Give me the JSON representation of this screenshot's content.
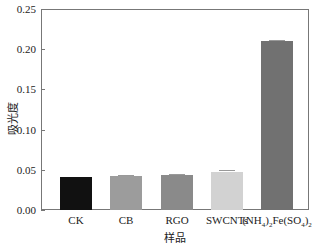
{
  "chart_data": {
    "type": "bar",
    "title": "",
    "xlabel": "样品",
    "ylabel": "吸光度",
    "ylim": [
      0,
      0.25
    ],
    "yticks": [
      "0.00",
      "0.05",
      "0.10",
      "0.15",
      "0.20",
      "0.25"
    ],
    "categories": [
      "CK",
      "CB",
      "RGO",
      "SWCNTs",
      "(NH4)2Fe(SO4)2"
    ],
    "values": [
      0.041,
      0.042,
      0.043,
      0.047,
      0.21
    ],
    "errors": [
      0.0,
      0.002,
      0.002,
      0.003,
      0.002
    ],
    "colors": [
      "#111111",
      "#9c9c9c",
      "#8a8a8a",
      "#d2d2d2",
      "#717171"
    ],
    "grid": false,
    "legend": null
  },
  "labels": {
    "cat4_parts": [
      "(NH",
      "4",
      ")",
      "2",
      "Fe(SO",
      "4",
      ")",
      "2"
    ]
  }
}
